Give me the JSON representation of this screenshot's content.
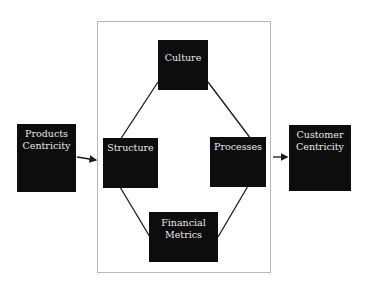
{
  "diagram": {
    "left_node": {
      "line1": "Products",
      "line2": "Centricity"
    },
    "right_node": {
      "line1": "Customer",
      "line2": "Centricity"
    },
    "inner_nodes": {
      "top": {
        "label": "Culture"
      },
      "left": {
        "label": "Structure"
      },
      "right": {
        "label": "Processes"
      },
      "bottom": {
        "line1": "Financial",
        "line2": "Metrics"
      }
    },
    "edges": [
      {
        "from": "Products Centricity",
        "to": "frame",
        "type": "arrow"
      },
      {
        "from": "frame",
        "to": "Customer Centricity",
        "type": "arrow"
      },
      {
        "from": "Culture",
        "to": "Structure",
        "type": "line"
      },
      {
        "from": "Culture",
        "to": "Processes",
        "type": "line"
      },
      {
        "from": "Structure",
        "to": "Financial Metrics",
        "type": "line"
      },
      {
        "from": "Processes",
        "to": "Financial Metrics",
        "type": "line"
      }
    ],
    "colors": {
      "box_fill": "#0d0d0d",
      "box_text": "#e8e8e8",
      "frame_border": "#b8b8b8",
      "line": "#1a1a1a"
    }
  }
}
